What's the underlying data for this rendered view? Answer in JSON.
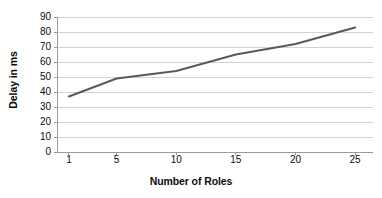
{
  "chart_data": {
    "type": "line",
    "title": "",
    "xlabel": "Number of Roles",
    "ylabel": "Delay in ms",
    "x": [
      1,
      5,
      10,
      15,
      20,
      25
    ],
    "values": [
      37,
      49,
      54,
      65,
      72,
      83
    ],
    "series": [
      {
        "name": "Delay",
        "values": [
          37,
          49,
          54,
          65,
          72,
          83
        ],
        "color": "#595959"
      }
    ],
    "xtick_labels": [
      "1",
      "5",
      "10",
      "15",
      "20",
      "25"
    ],
    "ytick_labels": [
      "0",
      "10",
      "20",
      "30",
      "40",
      "50",
      "60",
      "70",
      "80",
      "90"
    ],
    "ytick_values": [
      0,
      10,
      20,
      30,
      40,
      50,
      60,
      70,
      80,
      90
    ],
    "xlim": [
      0,
      26.5
    ],
    "ylim": [
      0,
      90
    ],
    "grid": "horizontal",
    "legend": "none",
    "line_color": "#595959",
    "gridline_color": "#d3d3d3",
    "axis_color": "#9a9a9a",
    "background": "#ffffff"
  }
}
